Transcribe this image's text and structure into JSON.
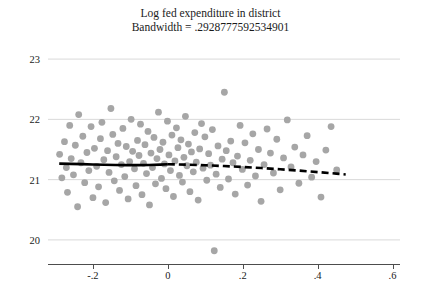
{
  "title": {
    "line1": "Log fed expenditure in district",
    "line2": "Bandwidth = .2928777592534901"
  },
  "chart_data": {
    "type": "scatter",
    "title": "Log fed expenditure in district",
    "subtitle": "Bandwidth = .2928777592534901",
    "xlabel": "",
    "ylabel": "",
    "xlim": [
      -0.32,
      0.62
    ],
    "ylim": [
      19.6,
      23.35
    ],
    "grid": true,
    "legend": false,
    "xticks": [
      "-.2",
      "0",
      ".2",
      ".4",
      ".6"
    ],
    "xtick_values": [
      -0.2,
      0,
      0.2,
      0.4,
      0.6
    ],
    "yticks": [
      "20",
      "21",
      "22",
      "23"
    ],
    "ytick_values": [
      20,
      21,
      22,
      23
    ],
    "marker_color": "#a6a6a6",
    "line_color": "#000000",
    "series": [
      {
        "name": "binned observations",
        "type": "scatter",
        "points": [
          [
            -0.289,
            21.42
          ],
          [
            -0.283,
            21.03
          ],
          [
            -0.276,
            21.63
          ],
          [
            -0.271,
            21.2
          ],
          [
            -0.268,
            20.79
          ],
          [
            -0.262,
            21.9
          ],
          [
            -0.258,
            21.35
          ],
          [
            -0.252,
            21.08
          ],
          [
            -0.247,
            21.57
          ],
          [
            -0.241,
            20.55
          ],
          [
            -0.238,
            22.08
          ],
          [
            -0.232,
            21.28
          ],
          [
            -0.227,
            21.72
          ],
          [
            -0.222,
            20.95
          ],
          [
            -0.216,
            21.45
          ],
          [
            -0.211,
            21.15
          ],
          [
            -0.205,
            21.88
          ],
          [
            -0.2,
            20.7
          ],
          [
            -0.196,
            21.52
          ],
          [
            -0.19,
            21.22
          ],
          [
            -0.185,
            20.88
          ],
          [
            -0.18,
            21.68
          ],
          [
            -0.176,
            21.95
          ],
          [
            -0.171,
            21.33
          ],
          [
            -0.166,
            20.62
          ],
          [
            -0.161,
            21.48
          ],
          [
            -0.157,
            21.12
          ],
          [
            -0.152,
            22.18
          ],
          [
            -0.147,
            21.75
          ],
          [
            -0.143,
            20.98
          ],
          [
            -0.138,
            21.38
          ],
          [
            -0.133,
            21.6
          ],
          [
            -0.129,
            20.82
          ],
          [
            -0.124,
            21.25
          ],
          [
            -0.12,
            21.85
          ],
          [
            -0.115,
            21.05
          ],
          [
            -0.111,
            21.55
          ],
          [
            -0.106,
            20.68
          ],
          [
            -0.102,
            21.3
          ],
          [
            -0.098,
            22.0
          ],
          [
            -0.094,
            21.47
          ],
          [
            -0.089,
            21.18
          ],
          [
            -0.085,
            20.9
          ],
          [
            -0.081,
            21.65
          ],
          [
            -0.077,
            21.4
          ],
          [
            -0.073,
            21.92
          ],
          [
            -0.069,
            20.75
          ],
          [
            -0.065,
            21.27
          ],
          [
            -0.061,
            21.58
          ],
          [
            -0.057,
            21.1
          ],
          [
            -0.053,
            21.8
          ],
          [
            -0.049,
            20.58
          ],
          [
            -0.045,
            21.44
          ],
          [
            -0.041,
            21.2
          ],
          [
            -0.037,
            21.7
          ],
          [
            -0.033,
            20.93
          ],
          [
            -0.029,
            21.35
          ],
          [
            -0.025,
            22.12
          ],
          [
            -0.021,
            21.5
          ],
          [
            -0.017,
            21.02
          ],
          [
            -0.013,
            21.62
          ],
          [
            -0.009,
            21.26
          ],
          [
            -0.005,
            20.85
          ],
          [
            -0.001,
            21.97
          ],
          [
            0.003,
            21.41
          ],
          [
            0.007,
            21.15
          ],
          [
            0.011,
            21.74
          ],
          [
            0.015,
            20.72
          ],
          [
            0.019,
            21.31
          ],
          [
            0.023,
            21.86
          ],
          [
            0.027,
            21.53
          ],
          [
            0.031,
            21.07
          ],
          [
            0.035,
            21.66
          ],
          [
            0.039,
            20.96
          ],
          [
            0.043,
            21.37
          ],
          [
            0.047,
            22.05
          ],
          [
            0.051,
            21.23
          ],
          [
            0.055,
            21.59
          ],
          [
            0.059,
            20.8
          ],
          [
            0.063,
            21.46
          ],
          [
            0.068,
            21.13
          ],
          [
            0.072,
            21.78
          ],
          [
            0.076,
            21.29
          ],
          [
            0.081,
            20.66
          ],
          [
            0.085,
            21.51
          ],
          [
            0.09,
            21.93
          ],
          [
            0.094,
            21.19
          ],
          [
            0.099,
            21.71
          ],
          [
            0.104,
            20.99
          ],
          [
            0.109,
            21.43
          ],
          [
            0.114,
            21.24
          ],
          [
            0.119,
            21.83
          ],
          [
            0.124,
            19.82
          ],
          [
            0.129,
            21.09
          ],
          [
            0.134,
            21.56
          ],
          [
            0.14,
            20.87
          ],
          [
            0.145,
            21.34
          ],
          [
            0.151,
            22.45
          ],
          [
            0.156,
            21.48
          ],
          [
            0.162,
            21.01
          ],
          [
            0.168,
            21.64
          ],
          [
            0.174,
            21.28
          ],
          [
            0.18,
            20.76
          ],
          [
            0.186,
            21.39
          ],
          [
            0.193,
            21.9
          ],
          [
            0.199,
            21.17
          ],
          [
            0.206,
            21.61
          ],
          [
            0.213,
            20.91
          ],
          [
            0.22,
            21.32
          ],
          [
            0.227,
            21.76
          ],
          [
            0.234,
            21.06
          ],
          [
            0.242,
            21.5
          ],
          [
            0.249,
            20.64
          ],
          [
            0.257,
            21.25
          ],
          [
            0.265,
            21.84
          ],
          [
            0.274,
            21.44
          ],
          [
            0.282,
            21.11
          ],
          [
            0.291,
            21.67
          ],
          [
            0.3,
            20.83
          ],
          [
            0.309,
            21.36
          ],
          [
            0.319,
            21.99
          ],
          [
            0.329,
            21.21
          ],
          [
            0.339,
            21.54
          ],
          [
            0.35,
            20.94
          ],
          [
            0.361,
            21.41
          ],
          [
            0.372,
            21.73
          ],
          [
            0.384,
            21.04
          ],
          [
            0.396,
            21.3
          ],
          [
            0.409,
            20.71
          ],
          [
            0.422,
            21.49
          ],
          [
            0.436,
            21.88
          ],
          [
            0.451,
            21.16
          ]
        ]
      },
      {
        "name": "local polynomial fit (left, solid)",
        "type": "line",
        "style": "solid",
        "points": [
          [
            -0.29,
            21.265
          ],
          [
            -0.26,
            21.262
          ],
          [
            -0.23,
            21.258
          ],
          [
            -0.2,
            21.252
          ],
          [
            -0.17,
            21.246
          ],
          [
            -0.14,
            21.242
          ],
          [
            -0.11,
            21.24
          ],
          [
            -0.08,
            21.24
          ],
          [
            -0.05,
            21.243
          ],
          [
            -0.02,
            21.249
          ],
          [
            0.0,
            21.255
          ]
        ]
      },
      {
        "name": "local polynomial fit (right, dashed)",
        "type": "line",
        "style": "dashed",
        "points": [
          [
            0.0,
            21.255
          ],
          [
            0.05,
            21.248
          ],
          [
            0.1,
            21.238
          ],
          [
            0.15,
            21.225
          ],
          [
            0.2,
            21.21
          ],
          [
            0.25,
            21.192
          ],
          [
            0.3,
            21.172
          ],
          [
            0.35,
            21.15
          ],
          [
            0.4,
            21.125
          ],
          [
            0.45,
            21.1
          ],
          [
            0.475,
            21.085
          ]
        ]
      }
    ]
  }
}
